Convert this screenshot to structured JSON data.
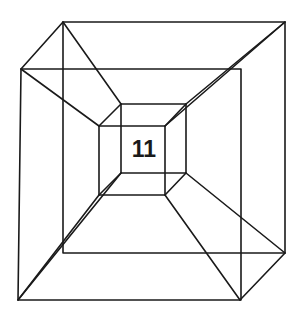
{
  "figure": {
    "label": "11",
    "stroke_color": "#1a1a1a",
    "background": "#ffffff"
  }
}
